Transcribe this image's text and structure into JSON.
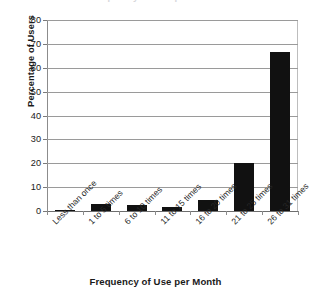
{
  "figure": {
    "background_color": "#ffffff",
    "bar_color": "#111111",
    "grid_color": "#9a9a9a",
    "axis_color": "#8c8c8c",
    "title_remnant": "Frequency of Use per Month"
  },
  "chart_data": {
    "type": "bar",
    "title": "",
    "xlabel": "Frequency of Use per Month",
    "ylabel": "Percentage of Users",
    "categories": [
      "Less than once",
      "1 to 5 times",
      "6 to 10 times",
      "11 to 15 times",
      "16 to 20 times",
      "21 to 25 times",
      "26 to 31 times"
    ],
    "values": [
      0.2,
      3,
      2.5,
      1.5,
      4.5,
      20,
      66.7
    ],
    "ylim": [
      0,
      80
    ],
    "ytick_step": 10,
    "yticks": [
      0,
      10,
      20,
      30,
      40,
      50,
      60,
      70,
      80
    ],
    "ytick_labels": [
      "0",
      "10",
      "20",
      "30",
      "40",
      "50",
      "60",
      "70",
      "80"
    ],
    "grid": "horizontal",
    "legend": "none",
    "bar_orientation": "vertical",
    "xtick_label_rotation": -45
  }
}
